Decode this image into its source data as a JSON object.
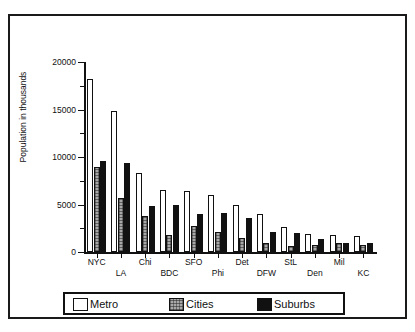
{
  "figure": {
    "background_color": "#ffffff",
    "frame_color": "#1a1a1a"
  },
  "chart_data": {
    "type": "bar",
    "title": "",
    "xlabel": "",
    "ylabel": "Population in thousands",
    "ylim": [
      0,
      20000
    ],
    "ytick_values": [
      0,
      5000,
      10000,
      15000,
      20000
    ],
    "ytick_labels": [
      "0",
      "5000",
      "10000",
      "15000",
      "20000"
    ],
    "minor_ytick_values": [
      2500,
      7500,
      12500,
      17500
    ],
    "grid": false,
    "legend_position": "bottom",
    "categories": [
      "NYC",
      "LA",
      "Chi",
      "BDC",
      "SFO",
      "Phi",
      "Det",
      "DFW",
      "StL",
      "Den",
      "Mil",
      "KC"
    ],
    "series": [
      {
        "name": "Metro",
        "color": "#ffffff",
        "pattern": "open",
        "values": [
          18200,
          14800,
          8350,
          6500,
          6450,
          6050,
          4900,
          4050,
          2600,
          1900,
          1750,
          1700
        ]
      },
      {
        "name": "Cities",
        "color": "#a8a8a8",
        "pattern": "crosshatch-gray",
        "values": [
          8900,
          5700,
          3800,
          1750,
          2750,
          2150,
          1500,
          1000,
          650,
          700,
          900,
          700
        ]
      },
      {
        "name": "Suburbs",
        "color": "#111111",
        "pattern": "solid-black",
        "values": [
          9600,
          9350,
          4800,
          4950,
          3950,
          4150,
          3550,
          2150,
          2050,
          1400,
          900,
          1000
        ]
      }
    ]
  },
  "legend": {
    "entries": [
      {
        "label": "Metro",
        "swatch": "metro"
      },
      {
        "label": "Cities",
        "swatch": "cities"
      },
      {
        "label": "Suburbs",
        "swatch": "suburbs"
      }
    ]
  }
}
